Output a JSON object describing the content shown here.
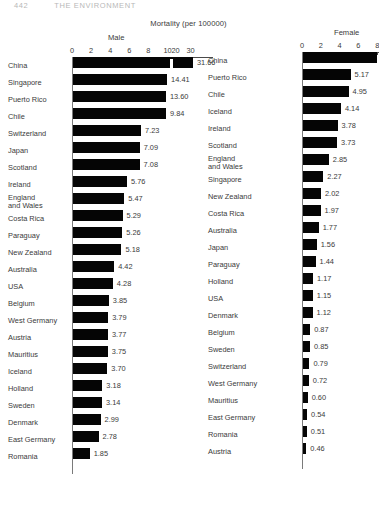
{
  "runhead": {
    "page_number": "442",
    "book_title": "THE ENVIRONMENT"
  },
  "chart_data": {
    "type": "bar",
    "title": "Mortality (per 100000)",
    "orientation": "horizontal",
    "panels": [
      {
        "name": "male",
        "title": "Male",
        "xlabel": "",
        "ylabel": "",
        "axis_broken": true,
        "tick_labels": [
          "0",
          "2",
          "4",
          "6",
          "8",
          "10",
          "20",
          "30"
        ],
        "tick_values": [
          0,
          2,
          4,
          6,
          8,
          10,
          20,
          30
        ],
        "xlim": [
          0,
          30
        ],
        "grid": false,
        "categories": [
          "China",
          "Singapore",
          "Puerto Rico",
          "Chile",
          "Switzerland",
          "Japan",
          "Scotland",
          "Ireland",
          "England\nand Wales",
          "Costa Rica",
          "Paraguay",
          "New Zealand",
          "Australia",
          "USA",
          "Belgium",
          "West Germany",
          "Austria",
          "Mauritius",
          "Iceland",
          "Holland",
          "Sweden",
          "Denmark",
          "East Germany",
          "Romania"
        ],
        "values": [
          31.66,
          14.41,
          13.6,
          9.84,
          7.23,
          7.09,
          7.08,
          5.76,
          5.47,
          5.29,
          5.26,
          5.18,
          4.42,
          4.28,
          3.85,
          3.79,
          3.77,
          3.75,
          3.7,
          3.18,
          3.14,
          2.99,
          2.78,
          1.85
        ],
        "value_labels": [
          "31.66",
          "14.41",
          "13.60",
          "9.84",
          "7.23",
          "7.09",
          "7.08",
          "5.76",
          "5.47",
          "5.29",
          "5.26",
          "5.18",
          "4.42",
          "4.28",
          "3.85",
          "3.79",
          "3.77",
          "3.75",
          "3.70",
          "3.18",
          "3.14",
          "2.99",
          "2.78",
          "1.85"
        ]
      },
      {
        "name": "female",
        "title": "Female",
        "xlabel": "",
        "ylabel": "",
        "axis_broken": false,
        "tick_labels": [
          "0",
          "2",
          "4",
          "6",
          "8"
        ],
        "tick_values": [
          0,
          2,
          4,
          6,
          8
        ],
        "xlim": [
          0,
          8
        ],
        "grid": false,
        "categories": [
          "China",
          "Puerto Rico",
          "Chile",
          "Iceland",
          "Ireland",
          "Scotland",
          "England\nand Wales",
          "Singapore",
          "New Zealand",
          "Costa Rica",
          "Australia",
          "Japan",
          "Paraguay",
          "Holland",
          "USA",
          "Denmark",
          "Belgium",
          "Sweden",
          "Switzerland",
          "West Germany",
          "Mauritius",
          "East Germany",
          "Romania",
          "Austria"
        ],
        "values": [
          8.6,
          5.17,
          4.95,
          4.14,
          3.78,
          3.73,
          2.85,
          2.27,
          2.02,
          1.97,
          1.77,
          1.56,
          1.44,
          1.17,
          1.15,
          1.12,
          0.87,
          0.85,
          0.79,
          0.72,
          0.6,
          0.54,
          0.51,
          0.46
        ],
        "value_labels": [
          "",
          "5.17",
          "4.95",
          "4.14",
          "3.78",
          "3.73",
          "2.85",
          "2.27",
          "2.02",
          "1.97",
          "1.77",
          "1.56",
          "1.44",
          "1.17",
          "1.15",
          "1.12",
          "0.87",
          "0.85",
          "0.79",
          "0.72",
          "0.60",
          "0.54",
          "0.51",
          "0.46"
        ]
      }
    ]
  },
  "colors": {
    "bar": "#050505",
    "text": "#3a3a3a",
    "axis": "#4a4a4a",
    "background": "#ffffff"
  }
}
